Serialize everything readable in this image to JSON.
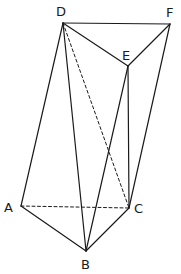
{
  "diagram": {
    "type": "solid-geometry",
    "vertices": [
      {
        "id": "A",
        "label": "A",
        "x": 21,
        "y": 206,
        "lx": 4,
        "ly": 201
      },
      {
        "id": "B",
        "label": "B",
        "x": 86,
        "y": 251,
        "lx": 81,
        "ly": 258
      },
      {
        "id": "C",
        "label": "C",
        "x": 129,
        "y": 208,
        "lx": 134,
        "ly": 202
      },
      {
        "id": "D",
        "label": "D",
        "x": 63,
        "y": 23,
        "lx": 56,
        "ly": 5
      },
      {
        "id": "E",
        "label": "E",
        "x": 128,
        "y": 66,
        "lx": 122,
        "ly": 49
      },
      {
        "id": "F",
        "label": "F",
        "x": 170,
        "y": 24,
        "lx": 166,
        "ly": 6
      }
    ],
    "edges": [
      {
        "from": "D",
        "to": "F",
        "style": "solid"
      },
      {
        "from": "D",
        "to": "E",
        "style": "solid"
      },
      {
        "from": "E",
        "to": "F",
        "style": "solid"
      },
      {
        "from": "D",
        "to": "A",
        "style": "solid"
      },
      {
        "from": "D",
        "to": "B",
        "style": "solid"
      },
      {
        "from": "D",
        "to": "C",
        "style": "dashed"
      },
      {
        "from": "E",
        "to": "B",
        "style": "solid"
      },
      {
        "from": "E",
        "to": "C",
        "style": "solid"
      },
      {
        "from": "F",
        "to": "C",
        "style": "solid"
      },
      {
        "from": "A",
        "to": "B",
        "style": "solid"
      },
      {
        "from": "B",
        "to": "C",
        "style": "solid"
      },
      {
        "from": "A",
        "to": "C",
        "style": "dashed"
      }
    ]
  }
}
